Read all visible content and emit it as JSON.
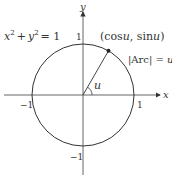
{
  "diagram": {
    "equation": {
      "lhs_x": "x",
      "sup_x": "2",
      "plus": "+",
      "lhs_y": "y",
      "sup_y": "2",
      "eq": "= 1"
    },
    "point_label": {
      "open": "(cos",
      "u1": "u",
      "sep": ", sin",
      "u2": "u",
      "close": ")"
    },
    "arc_label": {
      "text": "|Arc| = ",
      "u": "u"
    },
    "angle_label": "u",
    "axes": {
      "x_label": "x",
      "y_label": "y",
      "x_ticks": {
        "neg": "−1",
        "pos": "1"
      },
      "y_ticks": {
        "neg": "−1",
        "pos": "1"
      }
    },
    "colors": {
      "stroke": "#333333",
      "axis": "#555555",
      "point": "#222222"
    },
    "geometry": {
      "center": [
        83,
        95
      ],
      "radius": 51,
      "angle_deg": 60
    }
  }
}
